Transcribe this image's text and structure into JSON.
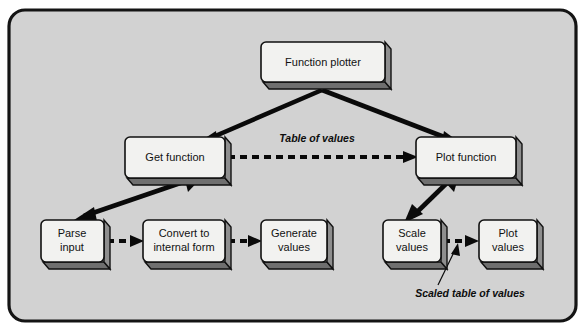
{
  "diagram": {
    "title_visible": false,
    "frame": {
      "background_color": "#d2d2d2",
      "border_color": "#141414"
    },
    "box_style": {
      "face_color": "#f2f2f0",
      "side_color": "#8e8e8e",
      "bottom_color": "#6f6f6f",
      "border_color": "#111111"
    },
    "nodes": [
      {
        "id": "function-plotter",
        "label": "Function plotter",
        "level": "top"
      },
      {
        "id": "get-function",
        "label": "Get function",
        "level": "middle"
      },
      {
        "id": "plot-function",
        "label": "Plot function",
        "level": "middle"
      },
      {
        "id": "parse-input",
        "label": "Parse\ninput",
        "line1": "Parse",
        "line2": "input",
        "level": "bottom"
      },
      {
        "id": "convert-internal",
        "label": "Convert to\ninternal form",
        "line1": "Convert to",
        "line2": "internal form",
        "level": "bottom"
      },
      {
        "id": "generate-values",
        "label": "Generate\nvalues",
        "line1": "Generate",
        "line2": "values",
        "level": "bottom"
      },
      {
        "id": "scale-values",
        "label": "Scale\nvalues",
        "line1": "Scale",
        "line2": "values",
        "level": "bottom"
      },
      {
        "id": "plot-values",
        "label": "Plot\nvalues",
        "line1": "Plot",
        "line2": "values",
        "level": "bottom"
      }
    ],
    "edge_labels": [
      {
        "id": "table-of-values",
        "text": "Table of values"
      },
      {
        "id": "scaled-table-of-values",
        "text": "Scaled table of values"
      }
    ],
    "connections": [
      {
        "from": "function-plotter",
        "to": "get-function",
        "style": "solid-thick",
        "arrows": "one-way"
      },
      {
        "from": "function-plotter",
        "to": "plot-function",
        "style": "solid-thick",
        "arrows": "one-way"
      },
      {
        "from": "get-function",
        "to": "plot-function",
        "style": "dashed-thick",
        "arrows": "one-way",
        "label": "Table of values"
      },
      {
        "from": "get-function",
        "to": "parse-input",
        "style": "solid-thick",
        "arrows": "two-way"
      },
      {
        "from": "plot-function",
        "to": "scale-values",
        "style": "solid-thick",
        "arrows": "two-way"
      },
      {
        "from": "parse-input",
        "to": "convert-internal",
        "style": "dashed-thick",
        "arrows": "one-way"
      },
      {
        "from": "convert-internal",
        "to": "generate-values",
        "style": "dashed-thick",
        "arrows": "one-way"
      },
      {
        "from": "scale-values",
        "to": "plot-values",
        "style": "dashed-thick",
        "arrows": "one-way",
        "label": "Scaled table of values"
      }
    ]
  }
}
